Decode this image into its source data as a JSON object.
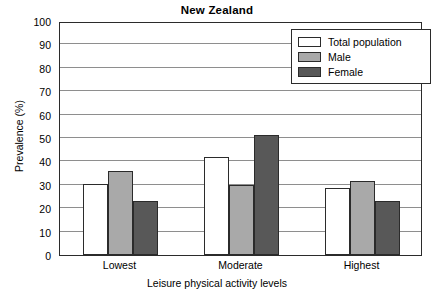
{
  "chart_data": {
    "type": "bar",
    "title": "New Zealand",
    "xlabel": "Leisure physical activity levels",
    "ylabel": "Prevalence (%)",
    "categories": [
      "Lowest",
      "Moderate",
      "Highest"
    ],
    "series": [
      {
        "name": "Total population",
        "values": [
          30.5,
          42.0,
          28.5
        ],
        "color": "#ffffff"
      },
      {
        "name": "Male",
        "values": [
          36.0,
          29.8,
          31.5
        ],
        "color": "#a9a9a9"
      },
      {
        "name": "Female",
        "values": [
          23.2,
          51.5,
          23.0
        ],
        "color": "#585858"
      }
    ],
    "ylim": [
      0,
      100
    ],
    "yticks": [
      0,
      10,
      20,
      30,
      40,
      50,
      60,
      70,
      80,
      90,
      100
    ],
    "ytick_labels": [
      "0",
      "10",
      "20",
      "30",
      "40",
      "50",
      "60",
      "70",
      "80",
      "90",
      "100"
    ],
    "grid": true,
    "legend_position": "top-right",
    "axis_color": "#2b2b2b",
    "grid_color": "#8e8e8e"
  },
  "legend": {
    "entries": [
      {
        "label": "Total population"
      },
      {
        "label": "Male"
      },
      {
        "label": "Female"
      }
    ]
  }
}
